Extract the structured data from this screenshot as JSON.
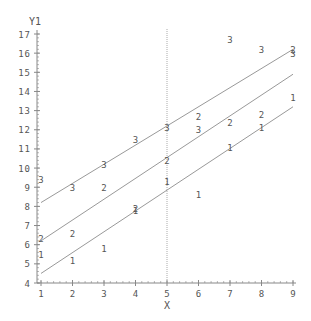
{
  "chart_data": {
    "type": "scatter",
    "title": "",
    "xlabel": "X",
    "ylabel": "Y1",
    "xlim": [
      1,
      9
    ],
    "ylim": [
      4,
      17
    ],
    "x_ticks": [
      "1",
      "2",
      "3",
      "4",
      "5",
      "6",
      "7",
      "8",
      "9"
    ],
    "y_ticks": [
      "4",
      "5",
      "6",
      "7",
      "8",
      "9",
      "10",
      "11",
      "12",
      "13",
      "14",
      "15",
      "16",
      "17"
    ],
    "grid": false,
    "reference_line": {
      "axis": "x",
      "value": 5
    },
    "marker_style": "group number as symbol",
    "series": [
      {
        "name": "1",
        "symbol": "1",
        "x": [
          1,
          2,
          3,
          4,
          5,
          6,
          7,
          8,
          9
        ],
        "y": [
          5.5,
          5.2,
          5.8,
          7.8,
          9.3,
          8.6,
          11.1,
          12.1,
          13.7
        ],
        "fit_line": {
          "x": [
            1,
            9
          ],
          "y": [
            4.5,
            13.2
          ]
        }
      },
      {
        "name": "2",
        "symbol": "2",
        "x": [
          1,
          2,
          3,
          4,
          5,
          6,
          7,
          8,
          9
        ],
        "y": [
          6.3,
          6.6,
          9.0,
          7.9,
          10.4,
          12.7,
          12.4,
          12.8,
          16.2
        ],
        "fit_line": {
          "x": [
            1,
            9
          ],
          "y": [
            6.2,
            14.9
          ]
        }
      },
      {
        "name": "3",
        "symbol": "3",
        "x": [
          1,
          2,
          3,
          4,
          5,
          6,
          7,
          8,
          9
        ],
        "y": [
          9.4,
          9.0,
          10.2,
          11.5,
          12.1,
          12.0,
          16.7,
          16.2,
          16.0
        ],
        "fit_line": {
          "x": [
            1,
            9
          ],
          "y": [
            8.2,
            16.2
          ]
        }
      }
    ]
  },
  "colors": {
    "axis": "#888888",
    "text": "#555555",
    "line": "#999999",
    "background": "#ffffff"
  }
}
